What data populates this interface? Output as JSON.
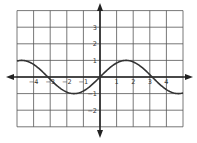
{
  "chart_data": {
    "type": "line",
    "title": "",
    "function": "y = sin(x)",
    "xlabel": "",
    "ylabel": "",
    "xlim": [
      -5,
      5
    ],
    "ylim": [
      -3,
      4
    ],
    "grid": true,
    "x_ticks": [
      -4,
      -3,
      -2,
      -1,
      0,
      1,
      2,
      3,
      4
    ],
    "x_tick_labels": [
      "-4",
      "-3",
      "-2",
      "-1",
      "0",
      "1",
      "2",
      "3",
      "4"
    ],
    "y_ticks": [
      3,
      2,
      1,
      -1,
      -2
    ],
    "y_tick_labels": [
      "3",
      "2",
      "1",
      "-1",
      "-2"
    ],
    "series": [
      {
        "name": "sin(x)",
        "x": [
          -5,
          -4.5,
          -4,
          -3.5,
          -3,
          -2.5,
          -2,
          -1.5,
          -1,
          -0.5,
          0,
          0.5,
          1,
          1.5,
          2,
          2.5,
          3,
          3.5,
          4,
          4.5,
          5
        ],
        "values": [
          0.96,
          0.98,
          0.76,
          0.35,
          -0.14,
          -0.6,
          -0.91,
          -1.0,
          -0.84,
          -0.48,
          0,
          0.48,
          0.84,
          1.0,
          0.91,
          0.6,
          0.14,
          -0.35,
          -0.76,
          -0.98,
          -0.96
        ]
      }
    ],
    "colors": {
      "curve": "#333333",
      "grid": "#555555",
      "axis": "#222222"
    }
  }
}
